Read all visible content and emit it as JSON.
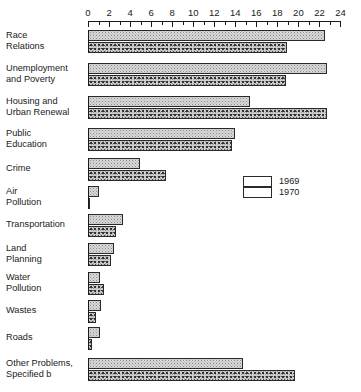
{
  "chart_data": {
    "type": "bar",
    "orientation": "horizontal",
    "title": "",
    "xlabel": "",
    "ylabel": "",
    "xlim": [
      0,
      24
    ],
    "xticks": [
      0,
      2,
      4,
      6,
      8,
      10,
      12,
      14,
      16,
      18,
      20,
      22,
      24
    ],
    "xtick_labels": [
      "0",
      "2",
      "4",
      "6",
      "8",
      "10",
      "12",
      "14",
      "16",
      "18",
      "20",
      "22",
      "24"
    ],
    "minor_tick_interval": 1,
    "grid": false,
    "legend_position": "middle-right",
    "categories": [
      "Race\nRelations",
      "Unemployment\nand  Poverty",
      "Housing and\nUrban Renewal",
      "Public\nEducation",
      "Crime",
      "Air\nPollution",
      "Transportation",
      "Land\nPlanning",
      "Water\nPollution",
      "Wastes",
      "Roads",
      "Other Problems,\nSpecified b"
    ],
    "series": [
      {
        "name": "1969",
        "values": [
          22.5,
          22.7,
          15.4,
          14.0,
          4.9,
          1.0,
          3.3,
          2.5,
          1.1,
          1.2,
          1.1,
          14.7
        ]
      },
      {
        "name": "1970",
        "values": [
          18.9,
          18.8,
          22.7,
          13.7,
          7.4,
          0.2,
          2.7,
          2.2,
          1.5,
          0.8,
          0.4,
          19.7
        ]
      }
    ],
    "legend": [
      "1969",
      "1970"
    ],
    "colors": {
      "series_1969": "#d9d9d9",
      "series_1970": "#9a9a9a",
      "axis": "#1a1a1a",
      "background": "#ffffff"
    }
  }
}
